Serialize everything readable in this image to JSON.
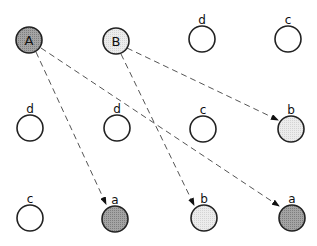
{
  "colors": {
    "stroke": "#222222",
    "empty": "#ffffff",
    "dark_fill": "#9a9a9a",
    "light_fill": "#e6e6e6",
    "edge": "#555555"
  },
  "nodes": [
    {
      "id": "A",
      "cx": 29,
      "cy": 40,
      "inner": "A",
      "label": "",
      "fill": "dark"
    },
    {
      "id": "B",
      "cx": 116,
      "cy": 41,
      "inner": "B",
      "label": "",
      "fill": "light"
    },
    {
      "id": "r0c2",
      "cx": 202,
      "cy": 39,
      "inner": "",
      "label": "d",
      "fill": "empty"
    },
    {
      "id": "r0c3",
      "cx": 288,
      "cy": 39,
      "inner": "",
      "label": "c",
      "fill": "empty"
    },
    {
      "id": "r1c0",
      "cx": 30,
      "cy": 128,
      "inner": "",
      "label": "d",
      "fill": "empty"
    },
    {
      "id": "r1c1",
      "cx": 117,
      "cy": 128,
      "inner": "",
      "label": "d",
      "fill": "empty"
    },
    {
      "id": "r1c2",
      "cx": 203,
      "cy": 129,
      "inner": "",
      "label": "c",
      "fill": "empty"
    },
    {
      "id": "r1c3",
      "cx": 291,
      "cy": 129,
      "inner": "",
      "label": "b",
      "fill": "light"
    },
    {
      "id": "r2c0",
      "cx": 30,
      "cy": 218,
      "inner": "",
      "label": "c",
      "fill": "empty"
    },
    {
      "id": "r2c1",
      "cx": 115,
      "cy": 219,
      "inner": "",
      "label": "a",
      "fill": "dark"
    },
    {
      "id": "r2c2",
      "cx": 204,
      "cy": 218,
      "inner": "",
      "label": "b",
      "fill": "light"
    },
    {
      "id": "r2c3",
      "cx": 292,
      "cy": 218,
      "inner": "",
      "label": "a",
      "fill": "dark"
    }
  ],
  "edges": [
    {
      "from": "A",
      "to": "r2c1",
      "x1": 36,
      "y1": 52,
      "x2": 106,
      "y2": 204
    },
    {
      "from": "A",
      "to": "r2c3",
      "x1": 41,
      "y1": 48,
      "x2": 279,
      "y2": 206
    },
    {
      "from": "B",
      "to": "r1c3",
      "x1": 127,
      "y1": 48,
      "x2": 278,
      "y2": 120
    },
    {
      "from": "B",
      "to": "r2c2",
      "x1": 121,
      "y1": 54,
      "x2": 194,
      "y2": 205
    }
  ]
}
